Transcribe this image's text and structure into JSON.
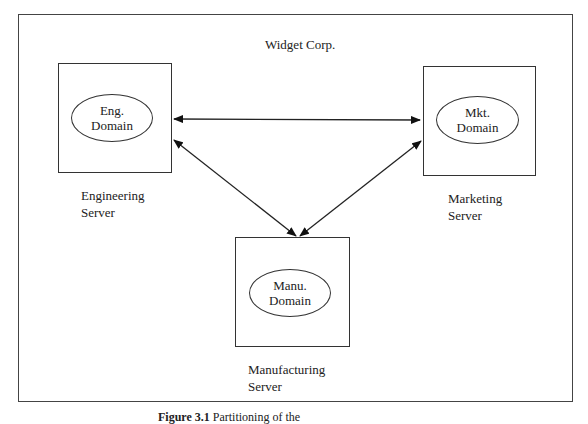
{
  "diagram": {
    "title": "Widget Corp.",
    "nodes": [
      {
        "id": "eng",
        "domain_line1": "Eng.",
        "domain_line2": "Domain",
        "server_line1": "Engineering",
        "server_line2": "Server"
      },
      {
        "id": "mkt",
        "domain_line1": "Mkt.",
        "domain_line2": "Domain",
        "server_line1": "Marketing",
        "server_line2": "Server"
      },
      {
        "id": "manu",
        "domain_line1": "Manu.",
        "domain_line2": "Domain",
        "server_line1": "Manufacturing",
        "server_line2": "Server"
      }
    ],
    "edges": [
      {
        "from": "eng",
        "to": "mkt",
        "type": "bidirectional"
      },
      {
        "from": "eng",
        "to": "manu",
        "type": "bidirectional"
      },
      {
        "from": "mkt",
        "to": "manu",
        "type": "bidirectional"
      }
    ]
  },
  "caption": {
    "label": "Figure 3.1",
    "text": " Partitioning of the"
  }
}
